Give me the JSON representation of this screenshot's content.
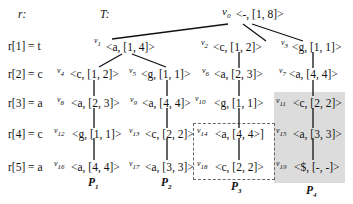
{
  "header": {
    "r_label": "r:",
    "t_label": "T:"
  },
  "rows": [
    {
      "label": "r[1] = t"
    },
    {
      "label": "r[2] = c"
    },
    {
      "label": "r[3] = a"
    },
    {
      "label": "r[4] = c"
    },
    {
      "label": "r[5] = a"
    }
  ],
  "nodes": {
    "v0": {
      "id": "v0",
      "text": "<-, [1, 8]>"
    },
    "v1": {
      "id": "v1",
      "text": "<a, [1, 4]>"
    },
    "v2": {
      "id": "v2",
      "text": "<c, [1, 2]>"
    },
    "v3": {
      "id": "v3",
      "text": "<g, [1, 1]>"
    },
    "v4": {
      "id": "v4",
      "text": "<c, [1, 2]>"
    },
    "v5": {
      "id": "v5",
      "text": "<g, [1, 1]>"
    },
    "v6": {
      "id": "v6",
      "text": "<a, [2, 3]>"
    },
    "v7": {
      "id": "v7",
      "text": "<a, [4, 4]>"
    },
    "v8": {
      "id": "v8",
      "text": "<a, [2, 3]>"
    },
    "v9": {
      "id": "v9",
      "text": "<a, [4, 4]>"
    },
    "v10": {
      "id": "v10",
      "text": "<g, [1, 1]>"
    },
    "v11": {
      "id": "v11",
      "text": "<c, [2, 2]>"
    },
    "v12": {
      "id": "v12",
      "text": "<g, [1, 1]>"
    },
    "v13": {
      "id": "v13",
      "text": "<c, [2, 2]>"
    },
    "v14": {
      "id": "v14",
      "text": "<a, [4, 4>]"
    },
    "v15": {
      "id": "v15",
      "text": "<a, [3, 3]>"
    },
    "v16": {
      "id": "v16",
      "text": "<a, [4, 4]>"
    },
    "v17": {
      "id": "v17",
      "text": "<a, [3, 3]>"
    },
    "v18": {
      "id": "v18",
      "text": "<c, [2, 2]>"
    },
    "v19": {
      "id": "v19",
      "text": "<$, [-, -]>"
    }
  },
  "paths": [
    {
      "label": "P1"
    },
    {
      "label": "P2"
    },
    {
      "label": "P3"
    },
    {
      "label": "P4"
    }
  ],
  "colors": {
    "shade": "#dcdcdc",
    "dash": "#666666",
    "line": "#111111"
  }
}
